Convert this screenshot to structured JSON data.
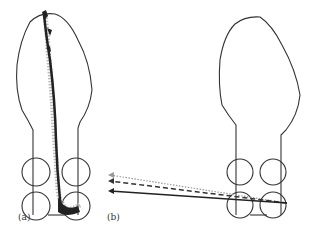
{
  "figure": {
    "panels": [
      {
        "id": "a",
        "label": "(a)",
        "description": "Foot outline with scattered trajectory traces from toe to heel"
      },
      {
        "id": "b",
        "label": "(b)",
        "description": "Foot outline with three arrow vectors (dotted, dashed, solid) pointing left from heel"
      }
    ],
    "arrows": [
      {
        "style": "dotted",
        "color": "#999999"
      },
      {
        "style": "dashed",
        "color": "#333333"
      },
      {
        "style": "solid",
        "color": "#222222"
      }
    ],
    "colors": {
      "outline": "#333333",
      "trace_dark": "#222222",
      "trace_light": "#aaaaaa"
    }
  }
}
